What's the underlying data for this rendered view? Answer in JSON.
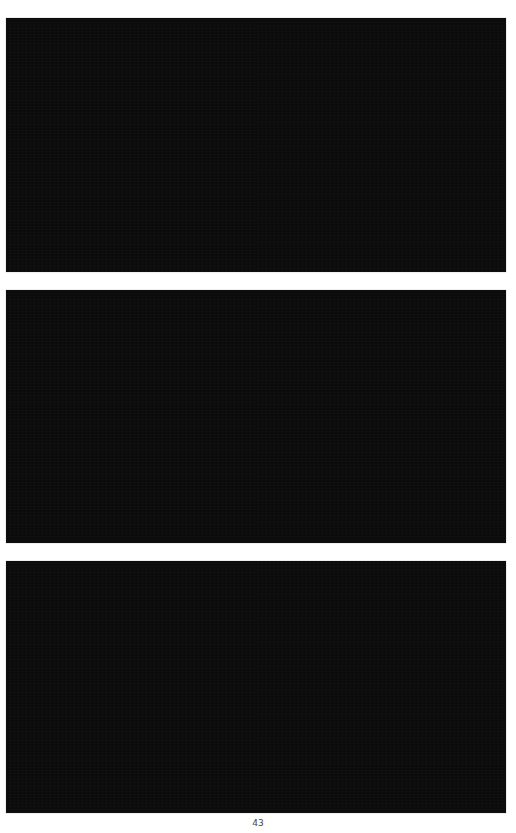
{
  "page": {
    "background": "#ffffff",
    "page_number": "43"
  },
  "figures": [
    {
      "id": "figure-1",
      "fill": "#0b0b0b"
    },
    {
      "id": "figure-2",
      "fill": "#0b0b0b"
    },
    {
      "id": "figure-3",
      "fill": "#0b0b0b"
    }
  ]
}
